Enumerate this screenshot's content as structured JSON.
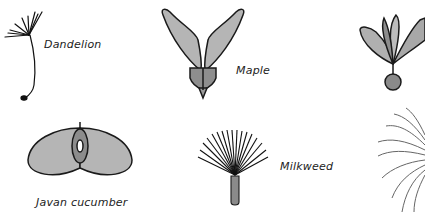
{
  "seeds": [
    {
      "name": "Dandelion"
    },
    {
      "name": "Maple"
    },
    {
      "name": "Javan cucumber"
    },
    {
      "name": "Milkweed"
    }
  ],
  "colors": {
    "fill_light": "#bdbdbd",
    "fill_mid": "#9e9e9e",
    "fill_dark": "#7a7a7a",
    "stroke": "#1a1a1a"
  }
}
